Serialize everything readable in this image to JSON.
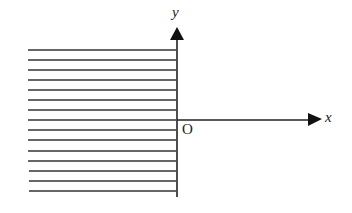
{
  "diagram": {
    "y_label": "y",
    "x_label": "x",
    "origin_label": "O",
    "hatch_lines": 15,
    "stroke_color": "#222222"
  }
}
